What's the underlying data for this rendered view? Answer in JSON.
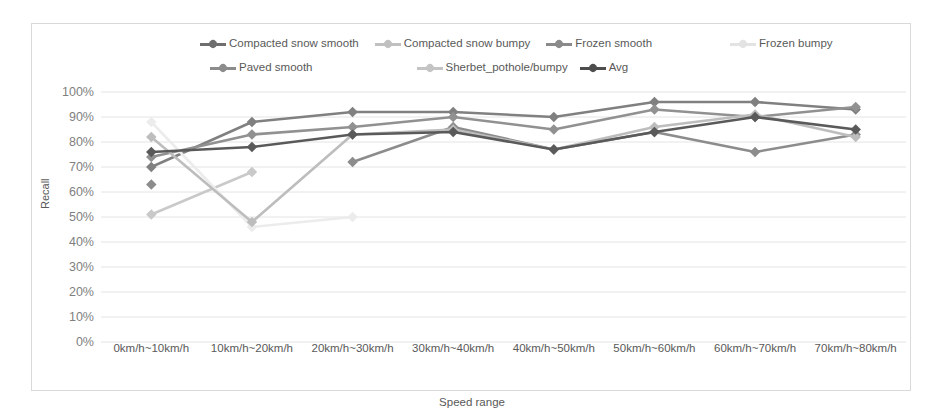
{
  "chart_data": {
    "type": "line",
    "title": "",
    "xlabel": "Speed range",
    "ylabel": "Recall",
    "ylim": [
      0,
      100
    ],
    "yticks": [
      "0%",
      "10%",
      "20%",
      "30%",
      "40%",
      "50%",
      "60%",
      "70%",
      "80%",
      "90%",
      "100%"
    ],
    "grid": true,
    "legend_position": "top",
    "categories": [
      "0km/h~10km/h",
      "10km/h~20km/h",
      "20km/h~30km/h",
      "30km/h~40km/h",
      "40km/h~50km/h",
      "50km/h~60km/h",
      "60km/h~70km/h",
      "70km/h~80km/h"
    ],
    "series": [
      {
        "name": "Compacted snow smooth",
        "color": "#808080",
        "values": [
          70,
          88,
          92,
          92,
          90,
          96,
          96,
          93
        ]
      },
      {
        "name": "Compacted snow bumpy",
        "color": "#c9c9c9",
        "values": [
          51,
          68,
          null,
          null,
          null,
          null,
          null,
          null
        ]
      },
      {
        "name": "Frozen smooth",
        "color": "#919191",
        "values": [
          74,
          83,
          86,
          90,
          85,
          93,
          90,
          94
        ]
      },
      {
        "name": "Frozen bumpy",
        "color": "#ececec",
        "values": [
          88,
          46,
          50,
          null,
          null,
          null,
          null,
          null
        ]
      },
      {
        "name": "Paved smooth",
        "color": "#8c8c8c",
        "values": [
          63,
          null,
          72,
          86,
          77,
          84,
          76,
          83
        ]
      },
      {
        "name": "Sherbet_pothole/bumpy",
        "color": "#bdbdbd",
        "values": [
          82,
          48,
          83,
          85,
          77,
          86,
          91,
          82
        ]
      },
      {
        "name": "Avg",
        "color": "#5a5a5a",
        "values": [
          76,
          78,
          83,
          84,
          77,
          84,
          90,
          85
        ]
      }
    ]
  },
  "legend": {
    "rows": [
      [
        {
          "label": "Compacted snow smooth",
          "color": "#6e6e6e"
        },
        {
          "label": "Compacted snow bumpy",
          "color": "#c0c0c0"
        },
        {
          "label": "Frozen smooth",
          "color": "#8a8a8a"
        },
        {
          "label": "Frozen bumpy",
          "color": "#e3e3e3"
        }
      ],
      [
        {
          "label": "Paved smooth",
          "color": "#8c8c8c"
        },
        {
          "label": "Sherbet_pothole/bumpy",
          "color": "#c4c4c4"
        },
        {
          "label": "Avg",
          "color": "#4d4d4d"
        }
      ]
    ]
  }
}
